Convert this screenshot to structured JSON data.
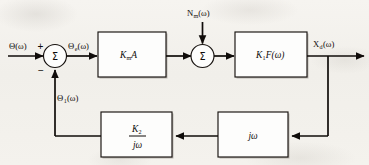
{
  "diagram": {
    "type": "control-system-block-diagram",
    "signals": {
      "input": {
        "label": "Θ(ω)",
        "name": "input-signal-theta"
      },
      "error": {
        "label": "Θ",
        "subscript": "e",
        "suffix": "(ω)",
        "name": "error-signal-theta-e"
      },
      "noise": {
        "label": "N",
        "subscript": "m",
        "suffix": "(ω)",
        "name": "noise-input-n-m"
      },
      "output": {
        "label": "X",
        "subscript": "d",
        "suffix": "(ω)",
        "name": "output-signal-x-d"
      },
      "feedback": {
        "label": "Θ",
        "subscript": "1",
        "suffix": "(ω)",
        "name": "feedback-signal-theta-1"
      }
    },
    "summing_junctions": [
      {
        "id": "sum-1",
        "glyph": "Σ",
        "plus_sign": "+",
        "minus_sign": "−"
      },
      {
        "id": "sum-2",
        "glyph": "Σ"
      }
    ],
    "blocks": [
      {
        "id": "block-km-a",
        "label": "K",
        "subscript": "m",
        "suffix": "A",
        "kind": "gain"
      },
      {
        "id": "block-k1-f",
        "label": "K",
        "subscript": "1",
        "suffix": "F(ω)",
        "kind": "transfer-function"
      },
      {
        "id": "block-jw",
        "label": "jω",
        "kind": "differentiator"
      },
      {
        "id": "block-k2-over-jw",
        "numerator": "K",
        "numerator_subscript": "2",
        "denominator": "jω",
        "kind": "integrator-gain"
      }
    ],
    "colors": {
      "line": "#100c0a",
      "block_fill": "#fdfdfc",
      "text": "#0f0b09",
      "paper": "#f3f1ed"
    }
  }
}
